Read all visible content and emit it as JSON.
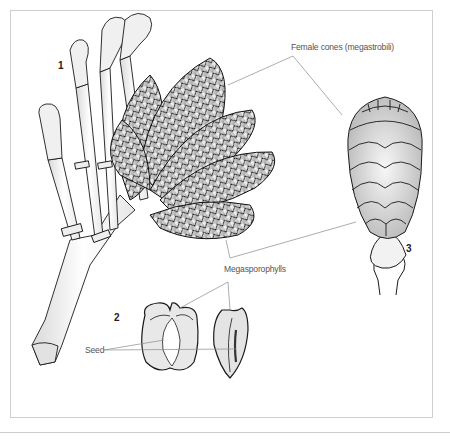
{
  "figure": {
    "panels": [
      {
        "number": "1",
        "subject": "branch-with-female-cones"
      },
      {
        "number": "2",
        "subject": "megasporophylls-with-seed"
      },
      {
        "number": "3",
        "subject": "single-female-cone"
      }
    ],
    "labels": {
      "female_cones": "Female cones (megastrobili)",
      "megasporophylls": "Megasporophylls",
      "seed": "Seed"
    },
    "colors": {
      "line": "#1a1a1a",
      "leader": "#888888",
      "frame": "#cfcfcf",
      "shade_light": "#f2f2f2",
      "shade_mid": "#c8c8c8",
      "shade_dark": "#8a8a8a"
    }
  }
}
